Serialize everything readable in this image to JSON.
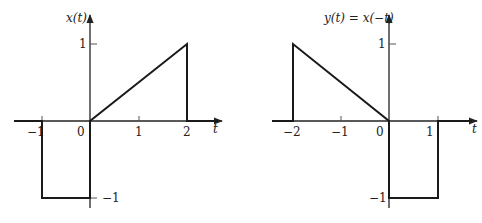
{
  "plots": [
    {
      "id": "x-of-t",
      "ylabel": "x(t)",
      "xlabel": "t",
      "x_ticks": [
        "−1",
        "0",
        "1",
        "2"
      ],
      "y_ticks": [
        "1",
        "−1"
      ],
      "signal_points": [
        [
          -1.5,
          0
        ],
        [
          -1,
          0
        ],
        [
          -1,
          -1
        ],
        [
          0,
          -1
        ],
        [
          0,
          0
        ],
        [
          2,
          1
        ],
        [
          2,
          0
        ],
        [
          2.7,
          0
        ]
      ]
    },
    {
      "id": "y-of-t",
      "ylabel": "y(t) = x(−t)",
      "xlabel": "t",
      "x_ticks": [
        "−2",
        "−1",
        "0",
        "1"
      ],
      "y_ticks": [
        "1",
        "−1"
      ],
      "signal_points": [
        [
          -2.5,
          0
        ],
        [
          -2,
          0
        ],
        [
          -2,
          1
        ],
        [
          0,
          0
        ],
        [
          0,
          -1
        ],
        [
          1,
          -1
        ],
        [
          1,
          0
        ],
        [
          1.8,
          0
        ]
      ]
    }
  ]
}
